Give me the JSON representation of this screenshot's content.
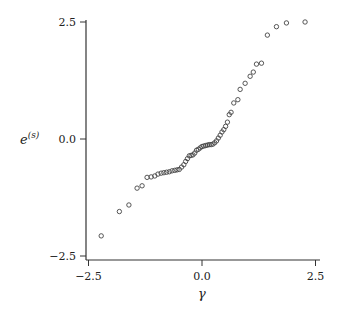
{
  "chart_data": {
    "type": "scatter",
    "title": "",
    "xlabel": "γ",
    "ylabel": "e(s)",
    "ylabel_base": "e",
    "ylabel_sup": "(s)",
    "xlim": [
      -2.5,
      2.5
    ],
    "ylim": [
      -2.5,
      2.5
    ],
    "xticks": [
      -2.5,
      0.0,
      2.5
    ],
    "xtick_labels": [
      "−2.5",
      "0.0",
      "2.5"
    ],
    "yticks": [
      -2.5,
      0.0,
      2.5
    ],
    "ytick_labels": [
      "−2.5",
      "0.0",
      "2.5"
    ],
    "grid": false,
    "legend": null,
    "marker": "open-circle",
    "series": [
      {
        "name": "points",
        "x": [
          -2.22,
          -1.82,
          -1.61,
          -1.43,
          -1.32,
          -1.21,
          -1.12,
          -1.04,
          -0.97,
          -0.9,
          -0.84,
          -0.78,
          -0.72,
          -0.66,
          -0.6,
          -0.55,
          -0.5,
          -0.45,
          -0.4,
          -0.36,
          -0.32,
          -0.28,
          -0.24,
          -0.2,
          -0.16,
          -0.12,
          -0.08,
          -0.04,
          0.0,
          0.04,
          0.08,
          0.12,
          0.16,
          0.2,
          0.24,
          0.28,
          0.32,
          0.36,
          0.4,
          0.44,
          0.48,
          0.52,
          0.56,
          0.6,
          0.64,
          0.7,
          0.79,
          0.84,
          0.95,
          1.06,
          1.13,
          1.2,
          1.31,
          1.44,
          1.64,
          1.86,
          2.27
        ],
        "y": [
          -2.07,
          -1.55,
          -1.41,
          -1.05,
          -1.0,
          -0.82,
          -0.81,
          -0.79,
          -0.75,
          -0.73,
          -0.72,
          -0.71,
          -0.7,
          -0.68,
          -0.67,
          -0.66,
          -0.65,
          -0.6,
          -0.55,
          -0.48,
          -0.42,
          -0.36,
          -0.35,
          -0.34,
          -0.3,
          -0.24,
          -0.22,
          -0.19,
          -0.16,
          -0.15,
          -0.14,
          -0.13,
          -0.12,
          -0.12,
          -0.11,
          -0.08,
          -0.04,
          0.02,
          0.08,
          0.15,
          0.2,
          0.27,
          0.36,
          0.52,
          0.57,
          0.77,
          0.84,
          1.06,
          1.19,
          1.34,
          1.43,
          1.6,
          1.62,
          2.22,
          2.4,
          2.48,
          2.5
        ]
      }
    ]
  }
}
